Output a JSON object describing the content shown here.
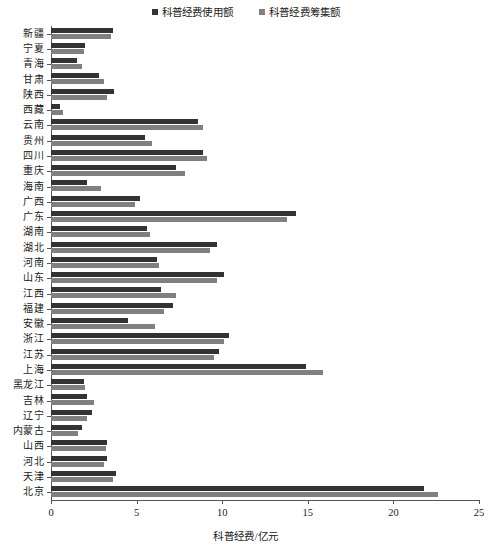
{
  "chart_data": {
    "type": "bar",
    "orientation": "horizontal",
    "title": "",
    "xlabel": "科普经费/亿元",
    "ylabel": "",
    "xlim": [
      0,
      25
    ],
    "xticks": [
      0,
      5,
      10,
      15,
      20,
      25
    ],
    "grid": false,
    "legend_position": "top-center",
    "categories": [
      "新疆",
      "宁夏",
      "青海",
      "甘肃",
      "陕西",
      "西藏",
      "云南",
      "贵州",
      "四川",
      "重庆",
      "海南",
      "广西",
      "广东",
      "湖南",
      "湖北",
      "河南",
      "山东",
      "江西",
      "福建",
      "安徽",
      "浙江",
      "江苏",
      "上海",
      "黑龙江",
      "吉林",
      "辽宁",
      "内蒙古",
      "山西",
      "河北",
      "天津",
      "北京"
    ],
    "series": [
      {
        "name": "科普经费使用额",
        "color": "#333333",
        "values": [
          3.6,
          2.0,
          1.5,
          2.8,
          3.7,
          0.5,
          8.6,
          5.5,
          8.9,
          7.3,
          2.1,
          5.2,
          14.3,
          5.6,
          9.7,
          6.2,
          10.1,
          6.4,
          7.1,
          4.5,
          10.4,
          9.8,
          14.9,
          1.9,
          2.1,
          2.4,
          1.8,
          3.3,
          3.3,
          3.8,
          21.8
        ]
      },
      {
        "name": "科普经费筹集额",
        "color": "#808080",
        "values": [
          3.5,
          1.9,
          1.8,
          3.1,
          3.3,
          0.7,
          8.9,
          5.9,
          9.1,
          7.8,
          2.9,
          4.9,
          13.8,
          5.8,
          9.3,
          6.3,
          9.7,
          7.3,
          6.6,
          6.1,
          10.1,
          9.5,
          15.9,
          2.0,
          2.5,
          2.1,
          1.6,
          3.2,
          3.1,
          3.6,
          22.6
        ]
      }
    ]
  }
}
